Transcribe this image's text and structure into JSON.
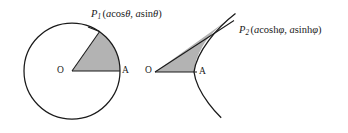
{
  "figure": {
    "background_color": "#ffffff",
    "stroke_color": "#1a1a1a",
    "fill_color": "#b3b3b3",
    "left_diagram": {
      "name": "circular-sector",
      "curve": "circle",
      "center_label": "O",
      "vertex_label": "A",
      "point_label_name": "P",
      "point_label_subscript": "1",
      "point_coordinates_open": "(",
      "point_coord_x_var": "a",
      "point_coord_x_fn": "cos",
      "point_coord_x_angle": "θ",
      "point_coord_sep": ", ",
      "point_coord_y_var": "a",
      "point_coord_y_fn": "sin",
      "point_coord_y_angle": "θ",
      "point_coordinates_close": ")",
      "center": {
        "x": 72,
        "y": 71
      },
      "radius": 48,
      "sector_angle_deg": 55
    },
    "right_diagram": {
      "name": "hyperbolic-sector",
      "curve": "hyperbola",
      "center_label": "O",
      "vertex_label": "A",
      "point_label_name": "P",
      "point_label_subscript": "2",
      "point_coordinates_open": "(",
      "point_coord_x_var": "a",
      "point_coord_x_fn": "cosh",
      "point_coord_x_angle": "φ",
      "point_coord_sep": ", ",
      "point_coord_y_var": "a",
      "point_coord_y_fn": "sinh",
      "point_coord_y_angle": "φ",
      "point_coordinates_close": ")",
      "center": {
        "x": 155,
        "y": 72
      },
      "vertex": {
        "x": 194,
        "y": 72
      },
      "a": 39,
      "b": 30,
      "phi": 1.18
    }
  }
}
